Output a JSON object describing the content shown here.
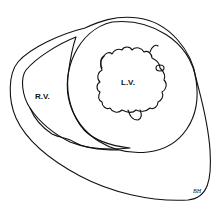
{
  "diagram": {
    "labels": {
      "right_ventricle": "R.V.",
      "left_ventricle": "L.V."
    },
    "signature": "BH",
    "stroke_color": "#111111",
    "background": "#ffffff"
  }
}
